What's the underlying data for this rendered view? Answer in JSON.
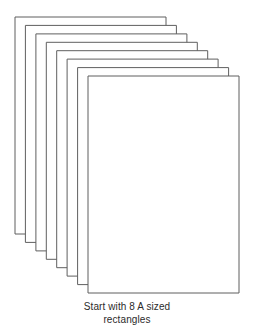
{
  "figure": {
    "name": "stack-of-8-a-sized-rectangles",
    "background_color": "#ffffff",
    "stroke_color": "#5f5f5f",
    "fill_color": "#ffffff",
    "sheet_count": 8,
    "sheet_width": 151,
    "sheet_height": 217,
    "step_x": 10.4,
    "step_y": 8.4,
    "back_sheet_origin": {
      "x": 15,
      "y": 17
    },
    "front_sheet_origin": {
      "x": 88,
      "y": 76
    },
    "sheets": [
      {
        "index": 1,
        "label": "sheet-8-back",
        "x": 15.0,
        "y": 17.0
      },
      {
        "index": 2,
        "label": "sheet-7",
        "x": 25.4,
        "y": 25.4
      },
      {
        "index": 3,
        "label": "sheet-6",
        "x": 35.9,
        "y": 33.9
      },
      {
        "index": 4,
        "label": "sheet-5",
        "x": 46.3,
        "y": 42.3
      },
      {
        "index": 5,
        "label": "sheet-4",
        "x": 56.7,
        "y": 50.7
      },
      {
        "index": 6,
        "label": "sheet-3",
        "x": 67.1,
        "y": 59.1
      },
      {
        "index": 7,
        "label": "sheet-2",
        "x": 77.6,
        "y": 67.6
      },
      {
        "index": 8,
        "label": "sheet-1-front",
        "x": 88.0,
        "y": 76.0
      }
    ]
  },
  "caption": {
    "line1": "Start with 8 A sized",
    "line2": "rectangles",
    "text": "Start with 8 A sized\nrectangles"
  },
  "chart_data": {
    "type": "diagram",
    "title": "Start with 8 A sized rectangles",
    "annotations": [
      "Start with 8 A sized",
      "rectangles"
    ],
    "items": 8,
    "item_shape": "rectangle",
    "item_aspect_ratio": "151:217",
    "arrangement": "offset-stack-descending-right-down",
    "values": [
      1,
      2,
      3,
      4,
      5,
      6,
      7,
      8
    ]
  }
}
